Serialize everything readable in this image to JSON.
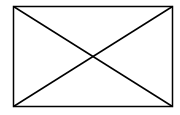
{
  "diagram": {
    "type": "image-placeholder",
    "background": "#ffffff",
    "stroke": "#000000",
    "stroke_width": 1.5,
    "rect": {
      "x": 13,
      "y": 6,
      "width": 160,
      "height": 101
    }
  }
}
